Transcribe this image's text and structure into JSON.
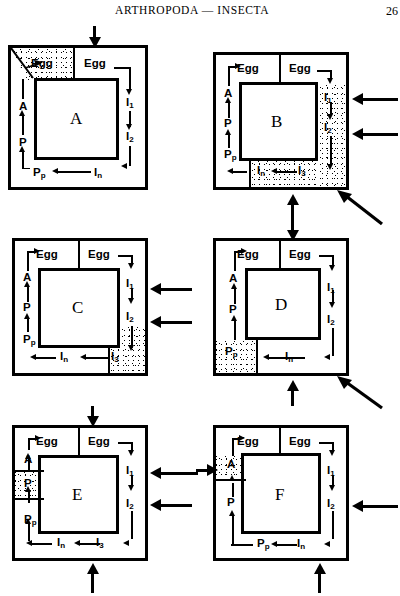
{
  "header": {
    "title": "ARTHROPODA — INSECTA",
    "folio": "26"
  },
  "diagram": {
    "caption_letters": [
      "A",
      "B",
      "C",
      "D",
      "E",
      "F"
    ],
    "stage_labels": {
      "egg_left": "Egg",
      "egg_right": "Egg",
      "instar_1": "I",
      "instar_1_sub": "1",
      "instar_2": "I",
      "instar_2_sub": "2",
      "instar_3": "I",
      "instar_3_sub": "3",
      "instar_n": "I",
      "instar_n_sub": "n",
      "prepupa": "P",
      "prepupa_sub": "p",
      "pupa": "P",
      "adult": "A"
    }
  },
  "panels": [
    {
      "id": "A",
      "letter": "A",
      "stippled_region": "top-left-corner-egg",
      "labels": [
        "Egg",
        "Egg",
        "I1",
        "I2",
        "In",
        "Pp",
        "P",
        "A"
      ],
      "external_arrows": [
        "top-down"
      ]
    },
    {
      "id": "B",
      "letter": "B",
      "stippled_region": "right-channel-and-bottom",
      "labels": [
        "Egg",
        "Egg",
        "I1",
        "I2",
        "I3",
        "In",
        "Pp",
        "P",
        "A"
      ],
      "external_arrows": [
        "right-upper",
        "right-lower",
        "bottom-up",
        "bottom-right-diagonal"
      ]
    },
    {
      "id": "C",
      "letter": "C",
      "stippled_region": "bottom-right-corner-i3",
      "labels": [
        "Egg",
        "Egg",
        "I1",
        "I2",
        "I3",
        "In",
        "Pp",
        "P",
        "A"
      ],
      "external_arrows": [
        "right-upper",
        "right-lower"
      ]
    },
    {
      "id": "D",
      "letter": "D",
      "stippled_region": "bottom-left-corner-pp",
      "labels": [
        "Egg",
        "Egg",
        "I1",
        "I2",
        "In",
        "Pp",
        "P",
        "A"
      ],
      "external_arrows": [
        "top-down",
        "bottom-up",
        "bottom-right-diagonal"
      ]
    },
    {
      "id": "E",
      "letter": "E",
      "stippled_region": "left-channel-pupa",
      "labels": [
        "Egg",
        "Egg",
        "I1",
        "I2",
        "I3",
        "In",
        "Pp",
        "P",
        "A"
      ],
      "external_arrows": [
        "top-down",
        "right-upper",
        "right-lower",
        "bottom-up"
      ]
    },
    {
      "id": "F",
      "letter": "F",
      "stippled_region": "left-channel-adult",
      "labels": [
        "Egg",
        "Egg",
        "I1",
        "I2",
        "In",
        "Pp",
        "P",
        "A"
      ],
      "external_arrows": [
        "left-in",
        "right-mid",
        "bottom-up"
      ]
    }
  ]
}
